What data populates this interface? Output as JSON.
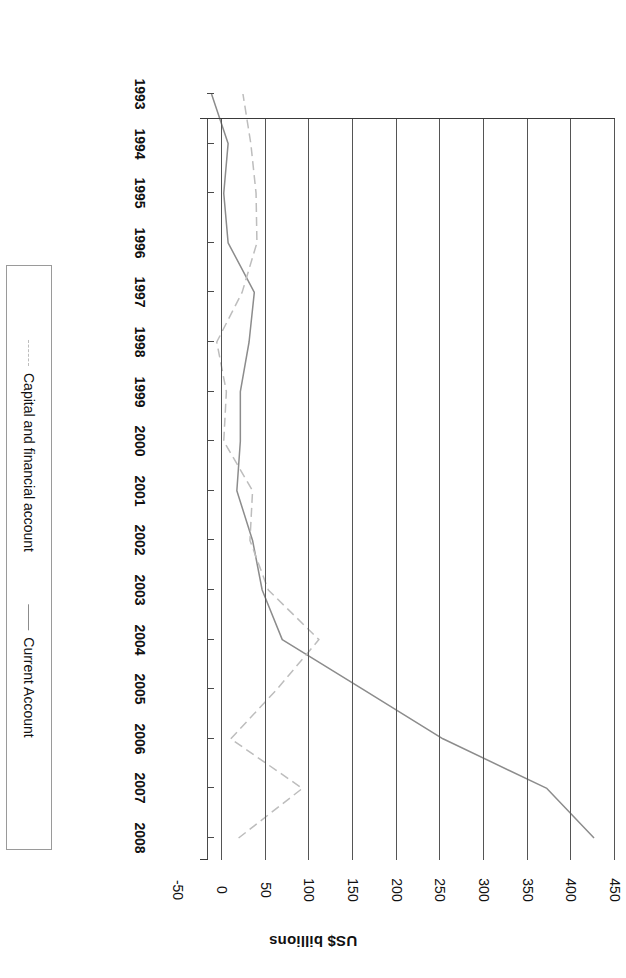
{
  "chart_data": {
    "type": "line",
    "title": "",
    "xlabel": "",
    "ylabel": "US$ billions",
    "categories": [
      "1993",
      "1994",
      "1995",
      "1996",
      "1997",
      "1998",
      "1999",
      "2000",
      "2001",
      "2002",
      "2003",
      "2004",
      "2005",
      "2006",
      "2007",
      "2008"
    ],
    "yticks": [
      "-50",
      "0",
      "50",
      "100",
      "150",
      "200",
      "250",
      "300",
      "350",
      "400",
      "450"
    ],
    "ylim": [
      -50,
      450
    ],
    "grid": "value-gridlines-only",
    "legend_position": "right",
    "rotation": "image is rotated 180 degrees",
    "series": [
      {
        "name": "Current Account",
        "style": "solid",
        "color": "#8c8c8c",
        "values": [
          -12,
          7,
          2,
          7,
          37,
          31,
          21,
          21,
          17,
          35,
          46,
          69,
          161,
          253,
          372,
          426
        ]
      },
      {
        "name": "Capital and financial account",
        "style": "dashed",
        "color": "#bdbdbd",
        "values": [
          24,
          33,
          39,
          40,
          23,
          -6,
          5,
          2,
          35,
          32,
          53,
          111,
          63,
          10,
          92,
          19
        ]
      }
    ]
  },
  "axis": {
    "value_axis_title": "US$ billions"
  },
  "legend": {
    "items": [
      {
        "label": "Current Account",
        "marker": "solid-line-swatch"
      },
      {
        "label": "Capital and financial account",
        "marker": "dashed-line-swatch"
      }
    ]
  },
  "colors": {
    "current_account": "#8c8c8c",
    "capital_account": "#c4c4c4",
    "grid": "#555555",
    "axis": "#3a3a3a",
    "text": "#111111"
  }
}
